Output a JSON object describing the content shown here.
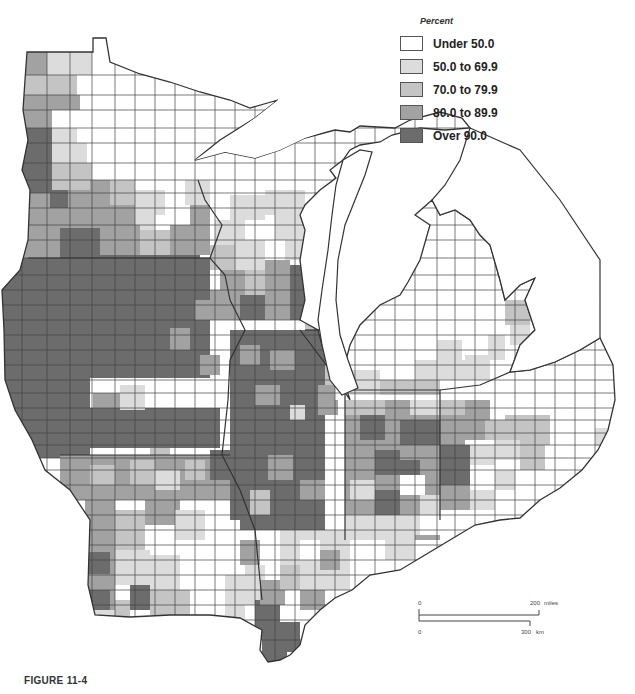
{
  "legend": {
    "title": "Percent",
    "items": [
      {
        "label": "Under 50.0",
        "color": "#ffffff"
      },
      {
        "label": "50.0 to 69.9",
        "color": "#dcdcdc"
      },
      {
        "label": "70.0 to 79.9",
        "color": "#c4c4c4"
      },
      {
        "label": "80.0 to 89.9",
        "color": "#a2a2a2"
      },
      {
        "label": "Over 90.0",
        "color": "#6c6c6c"
      }
    ]
  },
  "scale": {
    "miles_start": "0",
    "miles_end": "200",
    "miles_unit": "miles",
    "km_start": "0",
    "km_end": "300",
    "km_unit": "km"
  },
  "caption": "FIGURE 11-4",
  "colors": {
    "outline": "#333333",
    "county_line": "#444444",
    "water": "#ffffff"
  }
}
